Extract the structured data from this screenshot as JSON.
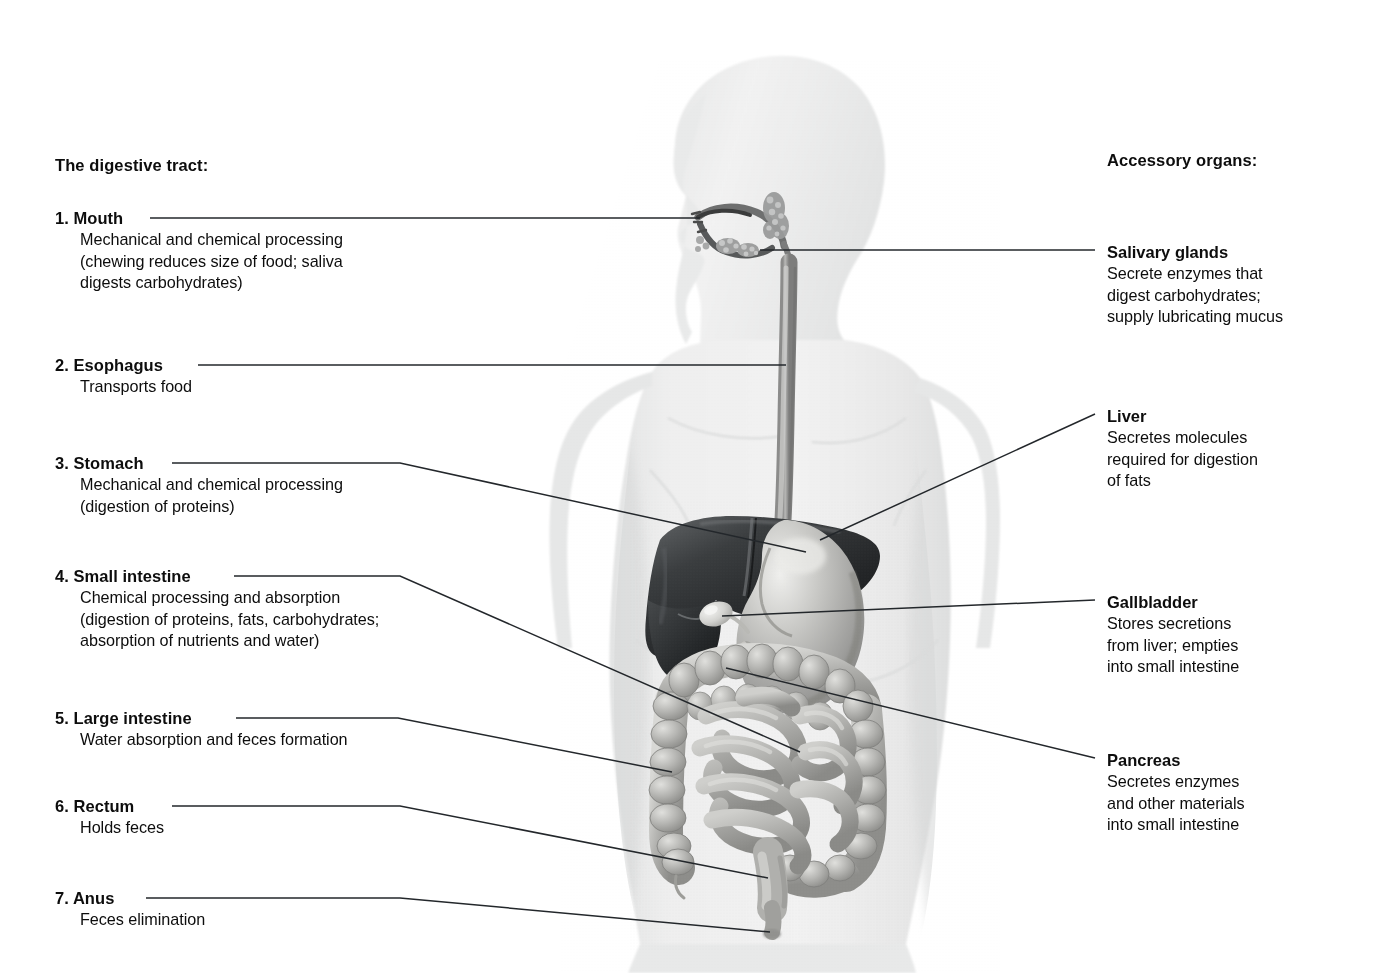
{
  "figure": {
    "style": "grayscale anatomical airbrush illustration"
  },
  "headings": {
    "left": "The digestive tract:",
    "right": "Accessory organs:"
  },
  "digestive_tract": [
    {
      "number": "1.",
      "term": "Mouth",
      "description": [
        "Mechanical and chemical processing",
        "(chewing reduces size of food; saliva",
        "digests carbohydrates)"
      ]
    },
    {
      "number": "2.",
      "term": "Esophagus",
      "description": [
        "Transports food"
      ]
    },
    {
      "number": "3.",
      "term": "Stomach",
      "description": [
        "Mechanical and chemical processing",
        "(digestion of proteins)"
      ]
    },
    {
      "number": "4.",
      "term": "Small intestine",
      "description": [
        "Chemical processing and absorption",
        "(digestion of proteins, fats, carbohydrates;",
        "absorption of nutrients and water)"
      ]
    },
    {
      "number": "5.",
      "term": "Large intestine",
      "description": [
        "Water absorption and feces formation"
      ]
    },
    {
      "number": "6.",
      "term": "Rectum",
      "description": [
        "Holds feces"
      ]
    },
    {
      "number": "7.",
      "term": "Anus",
      "description": [
        "Feces elimination"
      ]
    }
  ],
  "accessory_organs": [
    {
      "term": "Salivary glands",
      "description": [
        "Secrete enzymes that",
        "digest carbohydrates;",
        "supply lubricating mucus"
      ]
    },
    {
      "term": "Liver",
      "description": [
        "Secretes molecules",
        "required for digestion",
        "of fats"
      ]
    },
    {
      "term": "Gallbladder",
      "description": [
        "Stores secretions",
        "from liver; empties",
        "into small intestine"
      ]
    },
    {
      "term": "Pancreas",
      "description": [
        "Secretes enzymes",
        "and other materials",
        "into small intestine"
      ]
    }
  ],
  "colors": {
    "background": "#ffffff",
    "text": "#0d0d0d",
    "leader_line": "#23272b",
    "body_silhouette": "#ededee",
    "body_shadow": "#dcdddd",
    "liver_dark": "#2b2d2f",
    "stomach_mid": "#a9a9a8",
    "intestine_mid": "#b4b4b2",
    "esophagus": "#9a9a99",
    "highlight": "#f3f3f2"
  }
}
